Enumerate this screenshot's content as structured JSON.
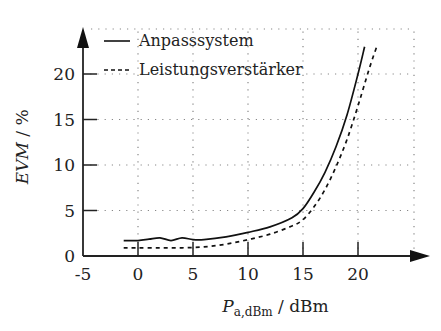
{
  "chart_data": {
    "type": "line",
    "title": "",
    "xlabel": "P_a,dBm / dBm",
    "xlabel_main": "P",
    "xlabel_sub": "a,dBm",
    "xlabel_unit": " / dBm",
    "ylabel": "EVM / %",
    "ylabel_main": "EVM",
    "ylabel_unit": " / %",
    "xlim": [
      -5,
      23
    ],
    "ylim": [
      0,
      24
    ],
    "xticks": [
      -5,
      0,
      5,
      10,
      15,
      20
    ],
    "yticks": [
      0,
      5,
      10,
      15,
      20
    ],
    "grid": true,
    "legend_position": "upper left",
    "series": [
      {
        "name": "Anpasssystem",
        "style": "solid",
        "x": [
          -1.3,
          0,
          1,
          2,
          3,
          4,
          5,
          6,
          8,
          10,
          12,
          14,
          15,
          16,
          17,
          18,
          19,
          20,
          20.6
        ],
        "y": [
          1.7,
          1.7,
          1.85,
          2.0,
          1.7,
          2.0,
          1.8,
          1.8,
          2.1,
          2.6,
          3.2,
          4.2,
          5.2,
          7.0,
          9.2,
          12.0,
          15.5,
          20.0,
          23.0
        ]
      },
      {
        "name": "Leistungsverstärker",
        "style": "dashed",
        "x": [
          -1.3,
          0,
          2,
          4,
          6,
          8,
          10,
          12,
          14,
          15,
          16,
          17,
          18,
          19,
          20,
          21,
          21.7
        ],
        "y": [
          0.9,
          0.9,
          0.9,
          0.9,
          1.0,
          1.3,
          1.8,
          2.4,
          3.3,
          4.0,
          5.4,
          7.3,
          9.8,
          12.8,
          16.5,
          20.5,
          23.0
        ]
      }
    ]
  }
}
